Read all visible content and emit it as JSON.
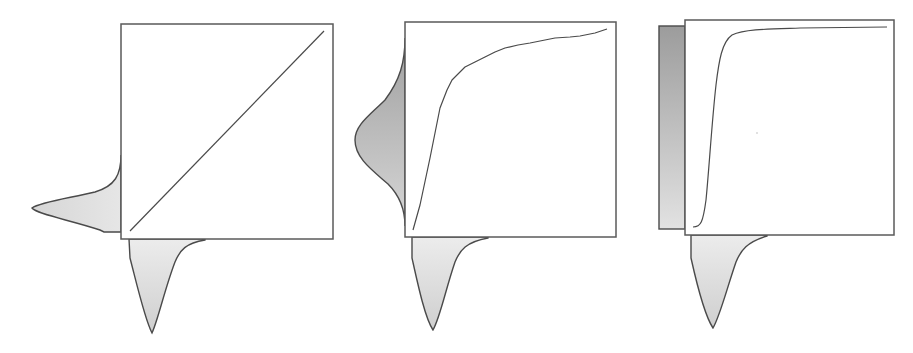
{
  "figure": {
    "colors": {
      "stroke": "#4a4a4a",
      "box_stroke": "#5a5a5a",
      "density_fill_light_top": "#ececec",
      "density_fill_light_bottom": "#cdcdcd",
      "density_fill_dark_top": "#9e9e9e",
      "density_fill_dark_bottom": "#d8d8d8"
    },
    "panels": [
      {
        "id": "panel-1",
        "box": {
          "x": 121,
          "y": 24,
          "w": 212,
          "h": 215
        },
        "mapping": "identity (diagonal line)",
        "curve_points": [
          [
            130,
            231
          ],
          [
            324,
            31
          ]
        ],
        "bottom_density": "right-skewed input distribution",
        "left_density": "right-skewed output distribution (same as input, rotated)"
      },
      {
        "id": "panel-2",
        "box": {
          "x": 405,
          "y": 22,
          "w": 211,
          "h": 215
        },
        "mapping": "concave increasing curve (partial CDF)",
        "curve_points": [
          [
            413,
            230
          ],
          [
            420,
            205
          ],
          [
            430,
            158
          ],
          [
            440,
            108
          ],
          [
            447,
            90
          ],
          [
            452,
            80
          ],
          [
            465,
            67
          ],
          [
            475,
            62
          ],
          [
            485,
            57
          ],
          [
            495,
            52
          ],
          [
            505,
            48
          ],
          [
            518,
            45
          ],
          [
            530,
            43
          ],
          [
            545,
            40
          ],
          [
            555,
            38
          ],
          [
            570,
            37
          ],
          [
            580,
            36
          ],
          [
            595,
            33
          ],
          [
            607,
            29
          ]
        ],
        "bottom_density": "right-skewed input distribution",
        "left_density": "bell-shaped output distribution"
      },
      {
        "id": "panel-3",
        "box": {
          "x": 685,
          "y": 20,
          "w": 209,
          "h": 215
        },
        "mapping": "CDF of the input (sigmoid-like)",
        "curve_points": [
          [
            693,
            227
          ],
          [
            700,
            224
          ],
          [
            704,
            215
          ],
          [
            707,
            195
          ],
          [
            710,
            160
          ],
          [
            713,
            120
          ],
          [
            716,
            85
          ],
          [
            719,
            58
          ],
          [
            723,
            43
          ],
          [
            730,
            35
          ],
          [
            740,
            31
          ],
          [
            760,
            29
          ],
          [
            790,
            28
          ],
          [
            840,
            27
          ],
          [
            887,
            27
          ]
        ],
        "bottom_density": "right-skewed input distribution",
        "left_density": "uniform output distribution (rectangle)"
      }
    ]
  }
}
